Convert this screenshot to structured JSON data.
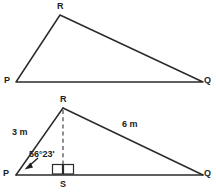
{
  "figure": {
    "background_color": "#ffffff",
    "line_color": "#2b2b2b",
    "label_color": "#1d1d1d",
    "dash_color": "#55555a"
  },
  "top_triangle": {
    "name": "triangle-pqr-plain",
    "vertices": [
      {
        "key": "P",
        "label": "P",
        "x": 16,
        "y": 82
      },
      {
        "key": "R",
        "label": "R",
        "x": 60,
        "y": 15
      },
      {
        "key": "Q",
        "label": "Q",
        "x": 203,
        "y": 82
      }
    ],
    "vertex_labels": {
      "p": "P",
      "r": "R",
      "q": "Q"
    }
  },
  "bottom_triangle": {
    "name": "triangle-pqr-with-altitude",
    "vertices": [
      {
        "key": "P",
        "label": "P",
        "x": 16,
        "y": 175
      },
      {
        "key": "R",
        "label": "R",
        "x": 63,
        "y": 108
      },
      {
        "key": "Q",
        "label": "Q",
        "x": 203,
        "y": 175
      },
      {
        "key": "S",
        "label": "S",
        "x": 63,
        "y": 175
      }
    ],
    "vertex_labels": {
      "p": "P",
      "r": "R",
      "q": "Q",
      "s": "S"
    },
    "side_labels": {
      "pr": "3 m",
      "rq": "6 m"
    },
    "angle_label": "56°23'",
    "altitude": {
      "from": "R",
      "to": "S",
      "style": "dashed"
    },
    "right_angle_markers": 2
  }
}
